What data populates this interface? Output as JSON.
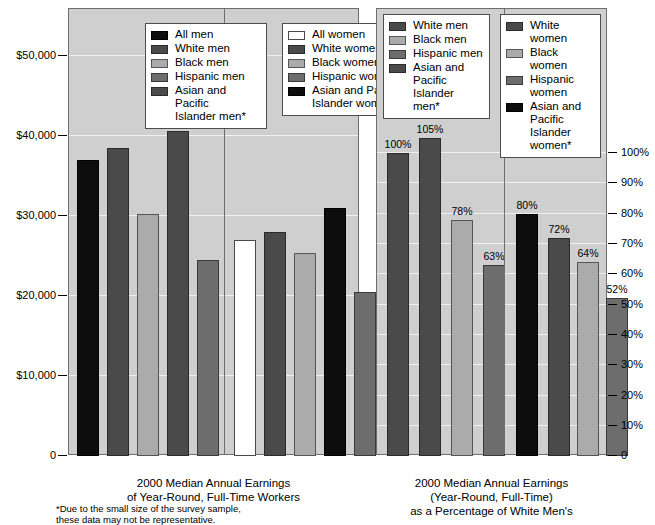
{
  "chart_data": [
    {
      "type": "bar",
      "id": "earnings-dollars",
      "title": "2000 Median Annual Earnings\nof Year-Round, Full-Time Workers",
      "xlabel": "",
      "ylabel": "",
      "ylim": [
        0,
        55000
      ],
      "grid": true,
      "legend_position": "top-inside",
      "ytick_labels": [
        "$50,000",
        "$40,000",
        "$30,000",
        "$20,000",
        "$10,000",
        "0"
      ],
      "ytick_values": [
        50000,
        40000,
        30000,
        20000,
        10000,
        0
      ],
      "groups": [
        {
          "name": "Men",
          "legend_title": "men",
          "categories": [
            "All men",
            "White men",
            "Black men",
            "Hispanic men",
            "Asian and Pacific\nIslander men*"
          ],
          "values": [
            37000,
            38500,
            30300,
            40600,
            24500
          ],
          "swatches": [
            "black",
            "dark",
            "light",
            "mid",
            "dark"
          ],
          "bar_order": [
            "All men",
            "White men",
            "Black men",
            "Asian and Pacific Islander men*",
            "Hispanic men"
          ],
          "bar_values": [
            37000,
            38500,
            30300,
            40600,
            24500
          ],
          "bar_swatches": [
            "black",
            "dark",
            "light",
            "dark",
            "mid"
          ]
        },
        {
          "name": "Women",
          "legend_title": "women",
          "categories": [
            "All women",
            "White women",
            "Black women",
            "Hispanic women",
            "Asian and Pacific\nIslander women*"
          ],
          "values": [
            27000,
            28000,
            25400,
            20500,
            31000
          ],
          "swatches": [
            "white",
            "dark",
            "light",
            "mid",
            "black"
          ],
          "bar_order": [
            "All women",
            "White women",
            "Black women",
            "Asian and Pacific Islander women*",
            "Hispanic women"
          ],
          "bar_values": [
            27000,
            28000,
            25400,
            31000,
            20500
          ],
          "bar_swatches": [
            "white",
            "dark",
            "light",
            "black",
            "mid"
          ]
        }
      ]
    },
    {
      "type": "bar",
      "id": "earnings-percent",
      "title": "2000 Median Annual Earnings\n(Year-Round, Full-Time)\nas a Percentage of White Men's",
      "xlabel": "",
      "ylabel": "",
      "ylim": [
        0,
        115
      ],
      "grid": true,
      "legend_position": "top-inside",
      "ytick_labels": [
        "100%",
        "90%",
        "80%",
        "70%",
        "60%",
        "50%",
        "40%",
        "30%",
        "20%",
        "10%",
        "0"
      ],
      "ytick_values": [
        100,
        90,
        80,
        70,
        60,
        50,
        40,
        30,
        20,
        10,
        0
      ],
      "groups": [
        {
          "name": "Men",
          "legend_title": "men",
          "categories": [
            "White men",
            "Black men",
            "Hispanic men",
            "Asian and Pacific\nIslander men*"
          ],
          "values": [
            100,
            78,
            63,
            105
          ],
          "swatches": [
            "dark",
            "light",
            "mid",
            "dark"
          ],
          "bar_order": [
            "White men",
            "Asian and Pacific Islander men*",
            "Black men",
            "Hispanic men"
          ],
          "bar_values": [
            100,
            105,
            78,
            63
          ],
          "bar_labels": [
            "100%",
            "105%",
            "78%",
            "63%"
          ],
          "bar_swatches": [
            "dark",
            "dark",
            "light",
            "mid"
          ]
        },
        {
          "name": "Women",
          "legend_title": "women",
          "categories": [
            "White women",
            "Black women",
            "Hispanic women",
            "Asian and Pacific\nIslander women*"
          ],
          "values": [
            72,
            64,
            52,
            80
          ],
          "swatches": [
            "dark",
            "light",
            "mid",
            "black"
          ],
          "bar_order": [
            "Asian and Pacific Islander women*",
            "White women",
            "Black women",
            "Hispanic women"
          ],
          "bar_values": [
            80,
            72,
            64,
            52
          ],
          "bar_labels": [
            "80%",
            "72%",
            "64%",
            "52%"
          ],
          "bar_swatches": [
            "black",
            "dark",
            "light",
            "mid"
          ]
        }
      ]
    }
  ],
  "left_chart": {
    "yaxis": {
      "ticks": [
        {
          "label": "$50,000",
          "y": 55
        },
        {
          "label": "$40,000",
          "y": 135
        },
        {
          "label": "$30,000",
          "y": 215
        },
        {
          "label": "$20,000",
          "y": 295
        },
        {
          "label": "$10,000",
          "y": 375
        },
        {
          "label": "0",
          "y": 455
        }
      ]
    },
    "legend_men": {
      "items": [
        {
          "label": "All men",
          "swatch": "black"
        },
        {
          "label": "White men",
          "swatch": "dark"
        },
        {
          "label": "Black men",
          "swatch": "light"
        },
        {
          "label": "Hispanic men",
          "swatch": "mid"
        },
        {
          "label": "Asian and Pacific\nIslander men*",
          "swatch": "dark"
        }
      ]
    },
    "legend_women": {
      "items": [
        {
          "label": "All women",
          "swatch": "white"
        },
        {
          "label": "White women",
          "swatch": "dark"
        },
        {
          "label": "Black women",
          "swatch": "light"
        },
        {
          "label": "Hispanic women",
          "swatch": "mid"
        },
        {
          "label": "Asian and Pacific\nIslander women*",
          "swatch": "black"
        }
      ]
    },
    "bars": [
      {
        "name": "All men",
        "value": 37000,
        "swatch": "black",
        "x": 8,
        "w": 22
      },
      {
        "name": "White men",
        "value": 38500,
        "swatch": "dark",
        "x": 38,
        "w": 22
      },
      {
        "name": "Black men",
        "value": 30300,
        "swatch": "light",
        "x": 68,
        "w": 22
      },
      {
        "name": "Asian and Pacific Islander men*",
        "value": 40600,
        "swatch": "dark",
        "x": 98,
        "w": 22
      },
      {
        "name": "Hispanic men",
        "value": 24500,
        "swatch": "mid",
        "x": 128,
        "w": 22
      },
      {
        "name": "All women",
        "value": 27000,
        "swatch": "white",
        "x": 165,
        "w": 22
      },
      {
        "name": "White women",
        "value": 28000,
        "swatch": "dark",
        "x": 195,
        "w": 22
      },
      {
        "name": "Black women",
        "value": 25400,
        "swatch": "light",
        "x": 225,
        "w": 22
      },
      {
        "name": "Asian and Pacific Islander women*",
        "value": 31000,
        "swatch": "black",
        "x": 255,
        "w": 22
      },
      {
        "name": "Hispanic women",
        "value": 20500,
        "swatch": "mid",
        "x": 285,
        "w": 22
      }
    ],
    "caption": "2000 Median Annual Earnings\nof Year-Round, Full-Time Workers"
  },
  "right_chart": {
    "yaxis": {
      "ticks": [
        {
          "label": "100%",
          "y": 152
        },
        {
          "label": "90%",
          "y": 182
        },
        {
          "label": "80%",
          "y": 213
        },
        {
          "label": "70%",
          "y": 243
        },
        {
          "label": "60%",
          "y": 273
        },
        {
          "label": "50%",
          "y": 304
        },
        {
          "label": "40%",
          "y": 334
        },
        {
          "label": "30%",
          "y": 364
        },
        {
          "label": "20%",
          "y": 395
        },
        {
          "label": "10%",
          "y": 425
        },
        {
          "label": "0",
          "y": 455
        }
      ]
    },
    "legend_men": {
      "items": [
        {
          "label": "White men",
          "swatch": "dark"
        },
        {
          "label": "Black men",
          "swatch": "light"
        },
        {
          "label": "Hispanic men",
          "swatch": "mid"
        },
        {
          "label": "Asian and Pacific\nIslander men*",
          "swatch": "dark"
        }
      ]
    },
    "legend_women": {
      "items": [
        {
          "label": "White women",
          "swatch": "dark"
        },
        {
          "label": "Black women",
          "swatch": "light"
        },
        {
          "label": "Hispanic women",
          "swatch": "mid"
        },
        {
          "label": "Asian and Pacific\nIslander women*",
          "swatch": "black"
        }
      ]
    },
    "bars": [
      {
        "name": "White men",
        "value": 100,
        "label": "100%",
        "swatch": "dark",
        "x": 10,
        "w": 22
      },
      {
        "name": "Asian and Pacific Islander men*",
        "value": 105,
        "label": "105%",
        "swatch": "dark",
        "x": 42,
        "w": 22
      },
      {
        "name": "Black men",
        "value": 78,
        "label": "78%",
        "swatch": "light",
        "x": 74,
        "w": 22
      },
      {
        "name": "Hispanic men",
        "value": 63,
        "label": "63%",
        "swatch": "mid",
        "x": 106,
        "w": 22
      },
      {
        "name": "Asian and Pacific Islander women*",
        "value": 80,
        "label": "80%",
        "swatch": "black",
        "x": 139,
        "w": 22
      },
      {
        "name": "White women",
        "value": 72,
        "label": "72%",
        "swatch": "dark",
        "x": 171,
        "w": 22
      },
      {
        "name": "Black women",
        "value": 64,
        "label": "64%",
        "swatch": "light",
        "x": 200,
        "w": 22
      },
      {
        "name": "Hispanic women",
        "value": 52,
        "label": "52%",
        "swatch": "mid",
        "x": 229,
        "w": 22
      }
    ],
    "caption": "2000 Median Annual Earnings\n(Year-Round, Full-Time)\nas a Percentage of White Men's"
  },
  "footnote": "*Due to the small size of the survey sample,\nthese data may not be representative."
}
